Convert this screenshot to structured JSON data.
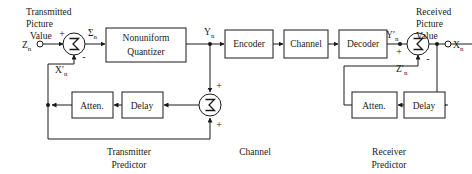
{
  "diagram": {
    "stroke_color": "#1a1a1a",
    "background_color": "#ffffff"
  },
  "blocks": {
    "quantizer_line1": "Nonuniform",
    "quantizer_line2": "Quantizer",
    "encoder": "Encoder",
    "channel": "Channel",
    "decoder": "Decoder",
    "tx_atten": "Atten.",
    "tx_delay": "Delay",
    "rx_atten": "Atten.",
    "rx_delay": "Delay"
  },
  "captions": {
    "transmitted_line1": "Transmitted",
    "transmitted_line2": "Picture",
    "transmitted_line3": "Value",
    "received_line1": "Received",
    "received_line2": "Picture",
    "received_line3": "Value",
    "transmitter_predictor_line1": "Transmitter",
    "transmitter_predictor_line2": "Predictor",
    "channel_section": "Channel",
    "receiver_predictor_line1": "Receiver",
    "receiver_predictor_line2": "Predictor"
  },
  "signals": {
    "input_base": "Z",
    "input_sub": "n",
    "error_base": "Σ",
    "error_sub": "n",
    "feedback_base": "X",
    "feedback_prime": "′",
    "feedback_sub": "n",
    "quantized_base": "Y",
    "quantized_sub": "n",
    "received_quantized_base": "Y",
    "received_quantized_prime": "′",
    "received_quantized_sub": "n",
    "received_pred_base": "Z",
    "received_pred_prime": "′",
    "received_pred_sub": "n",
    "output_base": "X",
    "output_sub": "n"
  },
  "signs": {
    "tx_sum_plus": "+",
    "tx_sum_minus": "-",
    "tx_pred_plus_top": "+",
    "tx_pred_plus_bottom": "+",
    "rx_sum_plus": "+",
    "rx_sum_minus": "-"
  },
  "sigma_glyph": "Σ"
}
